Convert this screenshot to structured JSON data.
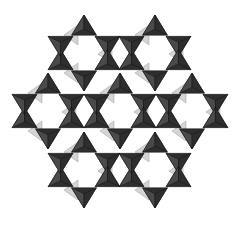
{
  "diagram": {
    "type": "crystal-structure-polyhedra",
    "background": "#ffffff",
    "colors": {
      "tetra_dark": "#2e2e2e",
      "tetra_mid": "#4a4a4a",
      "tetra_edge": "#1a1a1a",
      "tri_light": "#d4d4d4",
      "tri_light_edge": "#a8a8a8"
    },
    "ring_radius": 27,
    "tetra_size": 13,
    "rings": [
      {
        "id": "ring-1",
        "cx": 84,
        "cy": 53
      },
      {
        "id": "ring-2",
        "cx": 155,
        "cy": 53
      },
      {
        "id": "ring-3",
        "cx": 48,
        "cy": 111
      },
      {
        "id": "ring-4",
        "cx": 120,
        "cy": 111
      },
      {
        "id": "ring-5",
        "cx": 192,
        "cy": 111
      },
      {
        "id": "ring-6",
        "cx": 84,
        "cy": 170
      },
      {
        "id": "ring-7",
        "cx": 155,
        "cy": 170
      }
    ]
  }
}
